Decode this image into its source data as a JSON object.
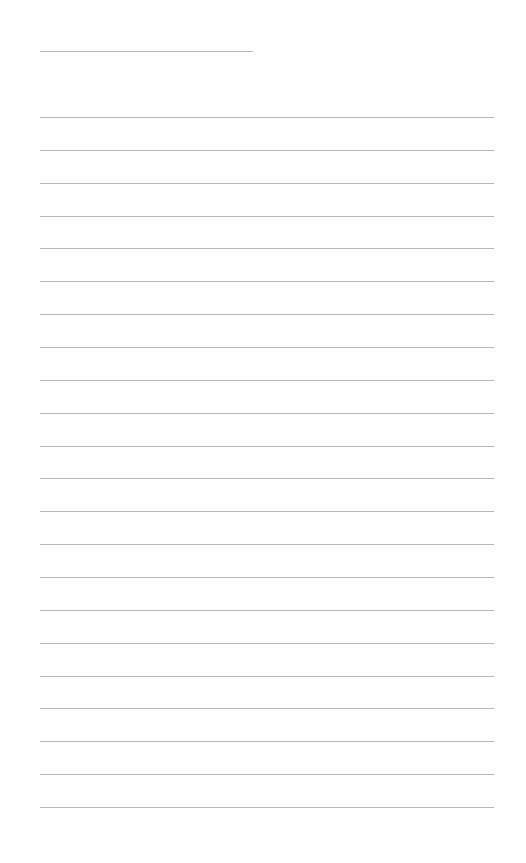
{
  "document": {
    "type": "blank lined sheet",
    "header_line": {
      "x": 40,
      "y": 51,
      "width": 213
    },
    "rules": {
      "x": 40,
      "width": 454,
      "first_y": 117,
      "spacing": 32.86,
      "count": 22
    },
    "line_color": "#b8b8b8",
    "background_color": "#fefefe"
  }
}
